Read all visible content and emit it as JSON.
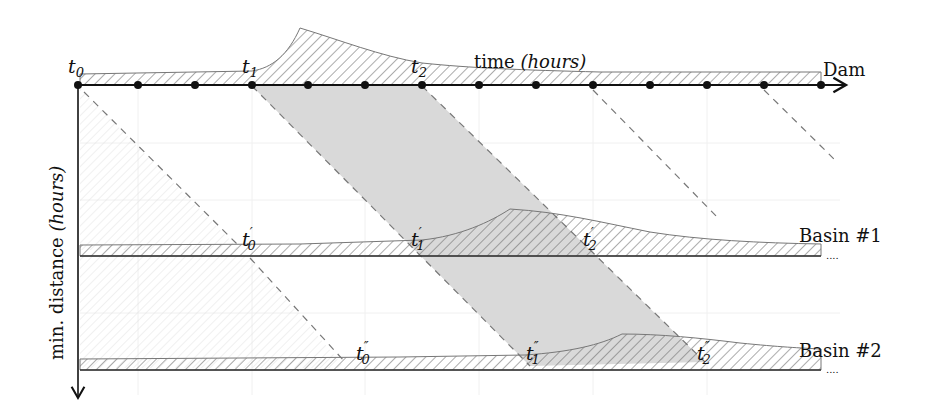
{
  "diagram": {
    "type": "space-time propagation diagram",
    "x_axis": {
      "label_main": "time",
      "label_unit": "(hours)"
    },
    "y_axis": {
      "label_main": "min. distance",
      "label_unit": "(hours)"
    },
    "rows": [
      {
        "name": "Dam",
        "label": "Dam",
        "times": [
          {
            "base": "t",
            "sub": "0",
            "primes": ""
          },
          {
            "base": "t",
            "sub": "1",
            "primes": ""
          },
          {
            "base": "t",
            "sub": "2",
            "primes": ""
          }
        ]
      },
      {
        "name": "Basin #1",
        "label": "Basin #1",
        "times": [
          {
            "base": "t",
            "sub": "0",
            "primes": "′"
          },
          {
            "base": "t",
            "sub": "1",
            "primes": "′"
          },
          {
            "base": "t",
            "sub": "2",
            "primes": "′"
          }
        ]
      },
      {
        "name": "Basin #2",
        "label": "Basin #2",
        "times": [
          {
            "base": "t",
            "sub": "0",
            "primes": "″"
          },
          {
            "base": "t",
            "sub": "1",
            "primes": "″"
          },
          {
            "base": "t",
            "sub": "2",
            "primes": "″"
          }
        ]
      }
    ],
    "tick_count": 14,
    "trailing_marker": "....",
    "colors": {
      "axis": "#111111",
      "hatch": "#555555",
      "shade": "#d9d9d9",
      "dash": "#777777",
      "grid": "#eeeeee"
    }
  }
}
